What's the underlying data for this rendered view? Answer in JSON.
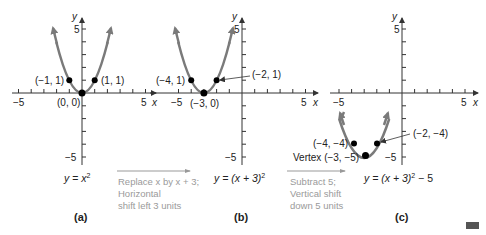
{
  "panels": [
    {
      "id": "a",
      "caption": "(a)",
      "equation": {
        "y": "y",
        "eq": " = ",
        "x": "x",
        "exp": "2",
        "rest": ""
      },
      "points": [
        {
          "label": "(−1, 1)",
          "x": -1,
          "y": 1
        },
        {
          "label": "(1, 1)",
          "x": 1,
          "y": 1
        },
        {
          "label": "(0, 0)",
          "x": 0,
          "y": 0
        }
      ],
      "axis": {
        "x_label": "x",
        "y_label": "y",
        "x_min_tick": "−5",
        "x_max_tick": "5",
        "y_max_tick": "5",
        "y_min_tick": "−5"
      }
    },
    {
      "id": "b",
      "caption": "(b)",
      "equation_text": "y = (x + 3)",
      "equation_exp": "2",
      "points": [
        {
          "label": "(−4, 1)",
          "x": -4,
          "y": 1
        },
        {
          "label": "(−2, 1)",
          "x": -2,
          "y": 1
        },
        {
          "label": "(−3, 0)",
          "x": -3,
          "y": 0
        }
      ],
      "axis": {
        "x_label": "x",
        "y_label": "y",
        "x_min_tick": "−5",
        "x_max_tick": "5",
        "y_max_tick": "5",
        "y_min_tick": "−5"
      }
    },
    {
      "id": "c",
      "caption": "(c)",
      "equation_text": "y = (x + 3)",
      "equation_exp": "2",
      "equation_tail": " − 5",
      "points": [
        {
          "label": "(−4, −4)",
          "x": -4,
          "y": -4
        },
        {
          "label": "(−2, −4)",
          "x": -2,
          "y": -4
        },
        {
          "label": "Vertex (−3, −5)",
          "x": -3,
          "y": -5
        }
      ],
      "axis": {
        "x_label": "x",
        "y_label": "y",
        "x_min_tick": "−5",
        "x_max_tick": "5",
        "y_max_tick": "5",
        "y_min_tick": "−5"
      }
    }
  ],
  "transforms": [
    {
      "line1": "Replace x by x + 3;",
      "line2": "Horizontal",
      "line3": "shift left 3 units"
    },
    {
      "line1": "Subtract 5;",
      "line2": "Vertical shift",
      "line3": "down 5 units"
    }
  ],
  "colors": {
    "curve": "#7a7a7a",
    "axis": "#333333",
    "point": "#000000",
    "transform_text": "#9a9a9a"
  }
}
